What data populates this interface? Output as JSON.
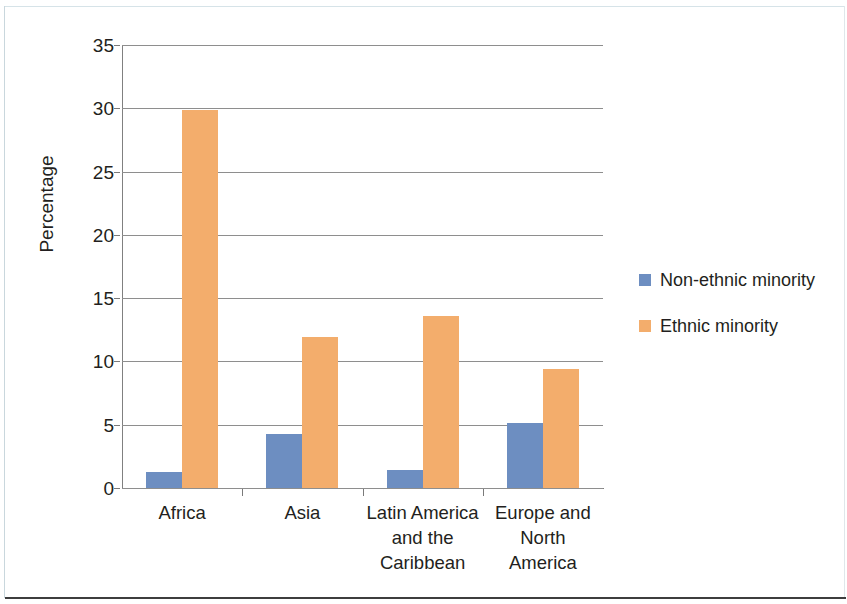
{
  "chart_data": {
    "type": "bar",
    "title": "",
    "subtitle": "",
    "xlabel": "",
    "ylabel": "Percentage",
    "ylim": [
      0,
      35
    ],
    "yticks": [
      0,
      5,
      10,
      15,
      20,
      25,
      30,
      35
    ],
    "ytick_labels": [
      "0",
      "5",
      "10",
      "15",
      "20",
      "25",
      "30",
      "35"
    ],
    "grid": true,
    "legend_position": "right",
    "categories": [
      "Africa",
      "Asia",
      "Latin America and the Caribbean",
      "Europe and North America"
    ],
    "category_label_lines": [
      [
        "Africa"
      ],
      [
        "Asia"
      ],
      [
        "Latin America",
        "and the",
        "Caribbean"
      ],
      [
        "Europe and",
        "North",
        "America"
      ]
    ],
    "series": [
      {
        "name": "Non-ethnic minority",
        "color": "#6D8EC1",
        "values": [
          1.3,
          4.3,
          1.4,
          5.1
        ]
      },
      {
        "name": "Ethnic minority",
        "color": "#F3AD6C",
        "values": [
          29.9,
          11.9,
          13.6,
          9.4
        ]
      }
    ]
  },
  "legend": {
    "items": [
      {
        "label": "Non-ethnic minority",
        "color": "#6D8EC1"
      },
      {
        "label": "Ethnic minority",
        "color": "#F3AD6C"
      }
    ]
  },
  "axes": {
    "y_title": "Percentage"
  },
  "colors": {
    "blue": "#6D8EC1",
    "orange": "#F3AD6C",
    "gridline": "#8e8e8e",
    "axis": "#808080",
    "text": "#231f20",
    "background": "#ffffff"
  }
}
